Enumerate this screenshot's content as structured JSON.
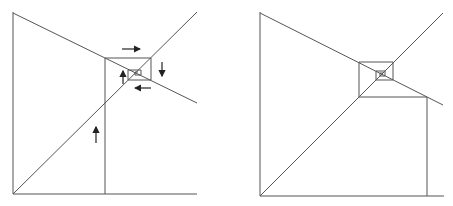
{
  "figure": {
    "panels": [
      {
        "id": "left",
        "label": "",
        "arrows": [
          "right",
          "down",
          "left",
          "up",
          "up"
        ]
      },
      {
        "id": "right",
        "label": "",
        "arrows": []
      }
    ],
    "colors": {
      "line": "#555555",
      "arrow": "#222222",
      "background": "#ffffff"
    }
  }
}
